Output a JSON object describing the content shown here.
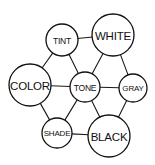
{
  "diagram": {
    "type": "node-link-graph",
    "background_color": "#ffffff",
    "line_color": "#111111",
    "node_fill": "#ffffff",
    "nodes": [
      {
        "id": "tint",
        "label": "TINT",
        "cx": 62,
        "cy": 40,
        "r": 16,
        "font_size": 8.5
      },
      {
        "id": "white",
        "label": "WHITE",
        "cx": 113,
        "cy": 35,
        "r": 21,
        "font_size": 11.5
      },
      {
        "id": "color",
        "label": "COLOR",
        "cx": 30,
        "cy": 85,
        "r": 21,
        "font_size": 11.5
      },
      {
        "id": "tone",
        "label": "TONE",
        "cx": 85,
        "cy": 87,
        "r": 15,
        "font_size": 8.5
      },
      {
        "id": "gray",
        "label": "GRAY",
        "cx": 133,
        "cy": 88,
        "r": 14,
        "font_size": 8
      },
      {
        "id": "shade",
        "label": "SHADE",
        "cx": 57,
        "cy": 133,
        "r": 15,
        "font_size": 8
      },
      {
        "id": "black",
        "label": "BLACK",
        "cx": 109,
        "cy": 136,
        "r": 21,
        "font_size": 11.5
      }
    ],
    "edges": [
      {
        "from": "tint",
        "to": "white"
      },
      {
        "from": "tint",
        "to": "color"
      },
      {
        "from": "tint",
        "to": "tone"
      },
      {
        "from": "white",
        "to": "tone"
      },
      {
        "from": "white",
        "to": "gray"
      },
      {
        "from": "color",
        "to": "tone"
      },
      {
        "from": "color",
        "to": "shade"
      },
      {
        "from": "tone",
        "to": "gray"
      },
      {
        "from": "tone",
        "to": "shade"
      },
      {
        "from": "tone",
        "to": "black"
      },
      {
        "from": "gray",
        "to": "black"
      },
      {
        "from": "shade",
        "to": "black"
      }
    ]
  }
}
